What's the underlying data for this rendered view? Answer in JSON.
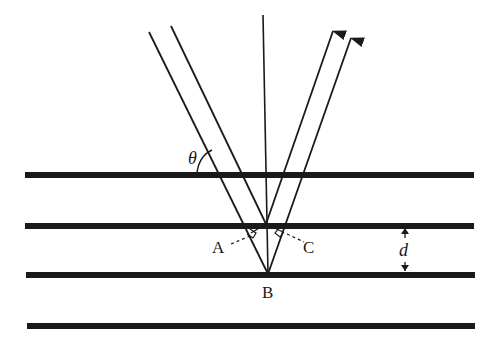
{
  "diagram": {
    "type": "bragg-diffraction",
    "labels": {
      "theta": "θ",
      "point_a": "A",
      "point_b": "B",
      "point_c": "C",
      "spacing": "d"
    },
    "colors": {
      "line": "#1a1a1a",
      "background": "#ffffff"
    },
    "planes": [
      {
        "y": 175
      },
      {
        "y": 226
      },
      {
        "y": 275
      },
      {
        "y": 326
      }
    ]
  }
}
